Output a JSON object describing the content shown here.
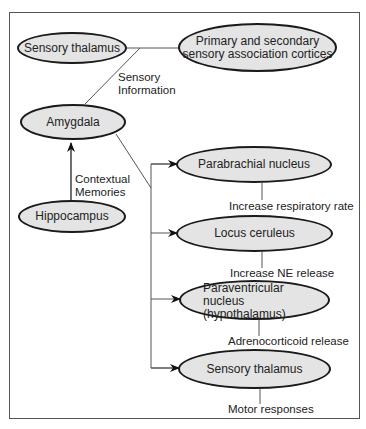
{
  "diagram": {
    "nodes": {
      "sensory_thalamus_top": "Sensory thalamus",
      "association_cortices_line1": "Primary and secondary",
      "association_cortices_line2": "sensory association cortices",
      "amygdala": "Amygdala",
      "hippocampus": "Hippocampus",
      "parabrachial": "Parabrachial nucleus",
      "locus_ceruleus": "Locus ceruleus",
      "paraventricular_line1": "Paraventricular nucleus",
      "paraventricular_line2": "(hypothalamus)",
      "sensory_thalamus_bottom": "Sensory thalamus"
    },
    "edge_labels": {
      "sensory_info_line1": "Sensory",
      "sensory_info_line2": "Information",
      "contextual_line1": "Contextual",
      "contextual_line2": "Memories"
    },
    "outputs": {
      "parabrachial": "Increase respiratory rate",
      "locus_ceruleus": "Increase NE release",
      "paraventricular": "Adrenocorticoid release",
      "sensory_thalamus": "Motor responses"
    },
    "colors": {
      "node_fill": "#e4e4e4",
      "stroke": "#1a1a1a",
      "line": "#555555"
    }
  }
}
